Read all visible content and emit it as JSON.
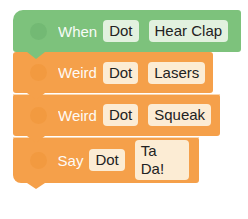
{
  "blocks": [
    {
      "type": "event",
      "color": "#7dc27c",
      "keyword": "When",
      "robot": "Dot",
      "action": "Hear Clap"
    },
    {
      "type": "action",
      "color": "#f5a04a",
      "keyword": "Weird",
      "robot": "Dot",
      "action": "Lasers"
    },
    {
      "type": "action",
      "color": "#f5a04a",
      "keyword": "Weird",
      "robot": "Dot",
      "action": "Squeak"
    },
    {
      "type": "action",
      "color": "#f5a04a",
      "keyword": "Say",
      "robot": "Dot",
      "action": "Ta Da!"
    }
  ]
}
